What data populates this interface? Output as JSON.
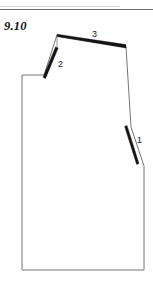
{
  "page": {
    "figure_number": "9.10",
    "background_color": "#ffffff",
    "header_rule_color": "#6d6d6d"
  },
  "diagram": {
    "type": "pattern-block-draft",
    "line_color": "#4a4a4a",
    "dart_color": "#141414",
    "outline_points": [
      [
        22,
        75
      ],
      [
        44,
        75
      ],
      [
        57,
        35
      ],
      [
        126,
        47
      ],
      [
        131,
        127
      ],
      [
        144,
        166
      ],
      [
        144,
        270
      ],
      [
        22,
        270
      ]
    ],
    "darts": [
      {
        "id": "1",
        "label": "1",
        "label_x": 137,
        "label_y": 136,
        "from": [
          126,
          127
        ],
        "to": [
          138,
          165
        ],
        "width": 3.2
      },
      {
        "id": "2",
        "label": "2",
        "label_x": 58,
        "label_y": 60,
        "from": [
          44,
          76
        ],
        "to": [
          57,
          48
        ],
        "width": 3.0
      },
      {
        "id": "3",
        "label": "3",
        "label_x": 92,
        "label_y": 30,
        "from": [
          57,
          35
        ],
        "to": [
          126,
          46
        ],
        "width": 3.0
      }
    ]
  }
}
